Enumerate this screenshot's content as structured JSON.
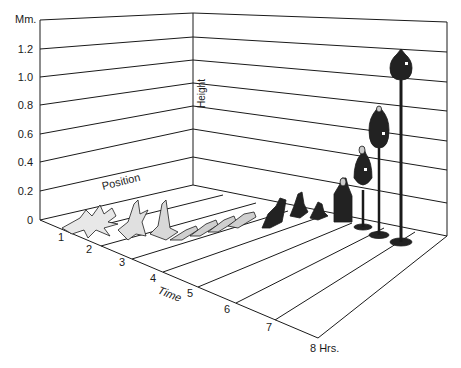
{
  "figure": {
    "y_axis": {
      "unit_label": "Mm.",
      "ticks": [
        "0",
        "0.2",
        "0.4",
        "0.6",
        "0.8",
        "1.0",
        "1.2"
      ],
      "title": "Height"
    },
    "x_axis": {
      "title": "Time",
      "ticks": [
        "1",
        "2",
        "3",
        "4",
        "5",
        "6",
        "7",
        "8 Hrs."
      ]
    },
    "z_axis": {
      "title": "Position"
    },
    "stages": [
      {
        "time": 1,
        "form": "spreading amoeboid cells",
        "height_mm": 0.05
      },
      {
        "time": 2,
        "form": "aggregating streams",
        "height_mm": 0.1
      },
      {
        "time": 2.5,
        "form": "tipped aggregate",
        "height_mm": 0.12
      },
      {
        "time": 3,
        "form": "migrating slugs",
        "height_mm": 0.05
      },
      {
        "time": 4,
        "form": "migrating slugs",
        "height_mm": 0.05
      },
      {
        "time": 5,
        "form": "culmination onset",
        "height_mm": 0.15
      },
      {
        "time": 5.5,
        "form": "mexican hat",
        "height_mm": 0.1
      },
      {
        "time": 6,
        "form": "early culminant",
        "height_mm": 0.3
      },
      {
        "time": 6.5,
        "form": "culminant with stalk",
        "height_mm": 0.45
      },
      {
        "time": 7,
        "form": "culminant with stalk",
        "height_mm": 0.7
      },
      {
        "time": 8,
        "form": "mature fruiting body",
        "height_mm": 1.1
      }
    ]
  },
  "colors": {
    "ink": "#1a1a1a",
    "background": "#ffffff",
    "organism_fill": "#222222"
  }
}
